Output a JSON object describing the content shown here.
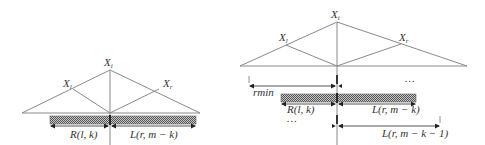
{
  "diagrams": {
    "left": {
      "nodes": {
        "apex": {
          "label": "X",
          "sub": "i"
        },
        "left": {
          "label": "X",
          "sub": "l"
        },
        "right": {
          "label": "X",
          "sub": "r"
        }
      },
      "segments": {
        "left_label": "R(l, k)",
        "right_label": "L(r, m − k)"
      }
    },
    "right": {
      "nodes": {
        "apex": {
          "label": "X",
          "sub": "i"
        },
        "left": {
          "label": "X",
          "sub": "l"
        },
        "right": {
          "label": "X",
          "sub": "r"
        }
      },
      "rows": [
        {
          "left_label": "rmin",
          "right_label": "",
          "ellipsis": "…"
        },
        {
          "left_label": "R(l, k)",
          "right_label": "L(r, m − k)",
          "ellipsis": ""
        },
        {
          "left_label": "",
          "right_label": "L(r, m − k − 1)",
          "ellipsis": "…"
        }
      ]
    }
  },
  "colors": {
    "line": "#8a8a8a",
    "hatch_dark": "#555555",
    "hatch_light": "#bdbdbd",
    "text": "#333333"
  }
}
